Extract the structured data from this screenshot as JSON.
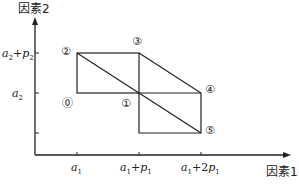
{
  "diagram": {
    "y_axis_label": "因素2",
    "x_axis_label": "因素1",
    "x_ticks": [
      {
        "base": "a",
        "sub": "1",
        "suffix": ""
      },
      {
        "base": "a",
        "sub": "1",
        "suffix": "+p",
        "suffix_sub": "1"
      },
      {
        "base": "a",
        "sub": "1",
        "suffix": "+2p",
        "suffix_sub": "1"
      }
    ],
    "y_ticks": [
      {
        "base": "a",
        "sub": "2",
        "suffix": "+p",
        "suffix_sub": "2"
      },
      {
        "base": "a",
        "sub": "2",
        "suffix": ""
      }
    ],
    "points": [
      {
        "label": "⓪",
        "id": "0"
      },
      {
        "label": "①",
        "id": "1"
      },
      {
        "label": "②",
        "id": "2"
      },
      {
        "label": "③",
        "id": "3"
      },
      {
        "label": "④",
        "id": "4"
      },
      {
        "label": "⑤",
        "id": "5"
      }
    ],
    "stroke_color": "#222222"
  }
}
